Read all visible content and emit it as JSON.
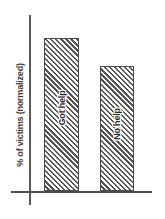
{
  "chart_data": {
    "type": "bar",
    "title": "",
    "subtitle": "",
    "xlabel": "",
    "ylabel": "% of victims (normalized)",
    "categories": [
      "Got help",
      "No help"
    ],
    "values": [
      100,
      82
    ],
    "ylim": [
      0,
      115
    ],
    "grid": false,
    "legend": null,
    "annotations": [],
    "style": {
      "fill": "diagonal-hatch",
      "bar_outline_color": "#4a4a4a",
      "hatch_color": "#555555",
      "axis_color": "#4d4d4d",
      "background": "#ffffff",
      "label_placement": "inside-bar-rotated"
    }
  },
  "axes": {
    "y_title": "% of victims (normalized)"
  },
  "bars": [
    {
      "label": "Got help",
      "value": 100
    },
    {
      "label": "No help",
      "value": 82
    }
  ]
}
